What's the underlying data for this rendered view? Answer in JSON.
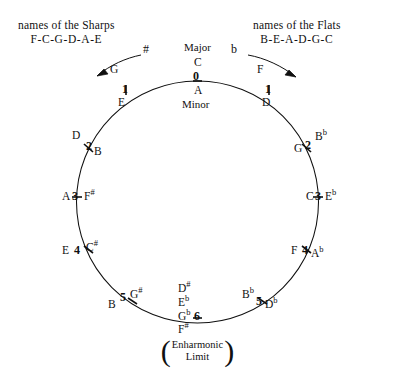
{
  "diagram": {
    "title_left": {
      "line1": "names of the Sharps",
      "line2": "F-C-G-D-A-E"
    },
    "title_right": {
      "line1": "names of the Flats",
      "line2": "B-E-A-D-G-C"
    },
    "sharp_symbol": "#",
    "flat_symbol": "b",
    "center": {
      "major_label": "Major",
      "minor_label": "Minor",
      "major_key": "C",
      "minor_key": "A",
      "accidental_count": "0"
    },
    "enharmonic": {
      "line1": "Enharmonic",
      "line2": "Limit",
      "paren_open": "(",
      "paren_close": ")"
    },
    "positions": [
      {
        "name": "sharps-1",
        "count": "1",
        "major": "G",
        "minor": "E"
      },
      {
        "name": "sharps-2",
        "count": "2",
        "major": "D",
        "minor": "B"
      },
      {
        "name": "sharps-3",
        "count": "3",
        "major": "A",
        "minor": "F",
        "minor_acc": "#"
      },
      {
        "name": "sharps-4",
        "count": "4",
        "major": "E",
        "minor": "C",
        "minor_acc": "#"
      },
      {
        "name": "sharps-5",
        "count": "5",
        "major": "B",
        "minor": "G",
        "minor_acc": "#"
      },
      {
        "name": "flats-1",
        "count": "1",
        "major": "F",
        "minor": "D"
      },
      {
        "name": "flats-2",
        "count": "2",
        "major": "G",
        "minor": "B",
        "minor_acc": "b"
      },
      {
        "name": "flats-3",
        "count": "3",
        "major": "C",
        "minor": "E",
        "minor_acc": "b"
      },
      {
        "name": "flats-4",
        "count": "4",
        "major": "F",
        "minor": "A",
        "minor_acc": "b"
      },
      {
        "name": "flats-5",
        "count": "5",
        "major": "B",
        "major_acc": "b",
        "minor": "D",
        "minor_acc": "b"
      }
    ],
    "bottom": {
      "count": "6",
      "sharp_major": "D",
      "sharp_major_acc": "#",
      "flat_major": "E",
      "flat_major_acc": "b",
      "flat_minor": "G",
      "flat_minor_acc": "b",
      "sharp_minor": "F",
      "sharp_minor_acc": "#"
    },
    "colors": {
      "ink": "#101010",
      "background": "#ffffff"
    }
  }
}
